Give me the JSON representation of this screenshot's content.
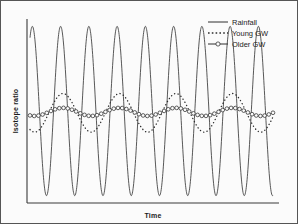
{
  "figure": {
    "background_color": "#fbfbfb",
    "border_color": "#555555"
  },
  "axes": {
    "x_title": "Time",
    "y_title": "Isotope ratio",
    "x_range_px": [
      26,
      278
    ],
    "y_range_px": [
      18,
      202
    ],
    "grid": false,
    "tick_labels_x": [],
    "tick_labels_y": []
  },
  "legend": {
    "position": "top-right",
    "items": [
      {
        "label": "Rainfall",
        "style": "solid-line",
        "color": "#2e2e2e"
      },
      {
        "label": "Young GW",
        "style": "dotted-line",
        "color": "#2e2e2e"
      },
      {
        "label": "Older GW",
        "style": "line-with-open-circles",
        "color": "#2e2e2e"
      }
    ]
  },
  "chart_data": {
    "type": "line",
    "title": "",
    "subtitle": "",
    "xlabel": "Time",
    "ylabel": "Isotope ratio",
    "xlim": [
      0,
      9
    ],
    "ylim": [
      0,
      1
    ],
    "grid": false,
    "legend_position": "top-right",
    "x_unit": "cycles (seasons/years)",
    "cycles": 8.6,
    "series": [
      {
        "name": "Rainfall",
        "style": "solid-line",
        "waveform": "sine",
        "amplitude": 0.46,
        "baseline": 0.5,
        "phase_deg": 60,
        "cycles": 8.6,
        "marker": "none",
        "description": "Large-amplitude seasonal oscillation spanning nearly the full isotope ratio axis."
      },
      {
        "name": "Young GW",
        "style": "dotted-line",
        "waveform": "sine",
        "amplitude": 0.105,
        "baseline": 0.49,
        "phase_deg": 240,
        "cycles": 4.3,
        "marker": "none",
        "description": "Damped and lagged oscillation with roughly half the frequency and much smaller amplitude than rainfall."
      },
      {
        "name": "Older GW",
        "style": "line-with-open-circles",
        "waveform": "sine",
        "amplitude": 0.022,
        "baseline": 0.495,
        "phase_deg": 240,
        "cycles": 4.3,
        "marker": "open-circle",
        "marker_count": 58,
        "description": "Nearly flat line of open circles; oscillation almost completely damped out."
      }
    ]
  }
}
